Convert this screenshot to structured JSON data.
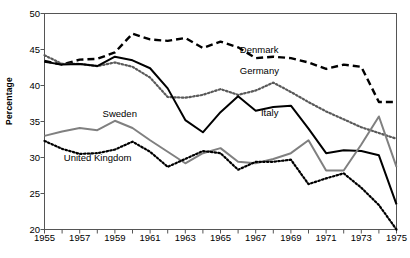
{
  "chart_data": {
    "type": "line",
    "title": "",
    "xlabel": "",
    "ylabel": "Percentage",
    "xlim": [
      1955,
      1975
    ],
    "ylim": [
      20,
      50
    ],
    "grid": false,
    "legend_position": "inline-annotations",
    "x": [
      1955,
      1956,
      1957,
      1958,
      1959,
      1960,
      1961,
      1962,
      1963,
      1964,
      1965,
      1966,
      1967,
      1968,
      1969,
      1970,
      1971,
      1972,
      1973,
      1974,
      1975
    ],
    "ytick_labels": [
      "20",
      "25",
      "30",
      "35",
      "40",
      "45",
      "50"
    ],
    "ytick_values": [
      20,
      25,
      30,
      35,
      40,
      45,
      50
    ],
    "xtick_labels": [
      "1955",
      "1957",
      "1959",
      "1961",
      "1963",
      "1965",
      "1967",
      "1969",
      "1971",
      "1973",
      "1975"
    ],
    "xtick_values": [
      1955,
      1957,
      1959,
      1961,
      1963,
      1965,
      1967,
      1969,
      1971,
      1973,
      1975
    ],
    "xtick_minor_values": [
      1956,
      1958,
      1960,
      1962,
      1964,
      1966,
      1968,
      1970,
      1972,
      1974
    ],
    "series": [
      {
        "name": "Denmark",
        "style": "dashed",
        "color": "#000000",
        "label_x": 1966.1,
        "label_y": 45.0,
        "values": [
          43.4,
          42.9,
          43.6,
          43.7,
          44.6,
          47.2,
          46.4,
          46.2,
          46.6,
          45.2,
          46.1,
          45.3,
          43.8,
          44.0,
          43.8,
          43.2,
          42.3,
          42.9,
          42.6,
          37.7,
          37.7
        ]
      },
      {
        "name": "Germany",
        "style": "dotted",
        "color": "#5a5a5a",
        "label_x": 1966.1,
        "label_y": 42.0,
        "values": [
          44.2,
          43.0,
          43.0,
          42.7,
          43.2,
          42.6,
          41.1,
          38.4,
          38.3,
          38.7,
          39.5,
          38.7,
          39.3,
          40.4,
          39.1,
          37.7,
          36.4,
          35.3,
          34.2,
          33.4,
          32.6
        ]
      },
      {
        "name": "Italy",
        "style": "solid",
        "color": "#000000",
        "label_x": 1967.3,
        "label_y": 36.2,
        "values": [
          43.3,
          42.9,
          43.0,
          42.7,
          44.0,
          43.5,
          42.4,
          39.6,
          35.2,
          33.5,
          36.3,
          38.5,
          36.5,
          37.0,
          37.2,
          34.0,
          30.6,
          31.0,
          30.9,
          30.3,
          23.5
        ]
      },
      {
        "name": "Sweden",
        "style": "solid",
        "color": "#808080",
        "label_x": 1958.3,
        "label_y": 36.0,
        "values": [
          33.0,
          33.6,
          34.1,
          33.8,
          35.1,
          34.1,
          32.4,
          30.8,
          29.2,
          30.6,
          31.3,
          29.4,
          29.2,
          29.8,
          30.6,
          32.4,
          28.2,
          28.2,
          31.8,
          35.7,
          28.7
        ]
      },
      {
        "name": "United Kingdom",
        "style": "dotted",
        "color": "#000000",
        "label_x": 1956.1,
        "label_y": 30.0,
        "values": [
          32.3,
          31.2,
          30.5,
          30.6,
          31.1,
          32.2,
          30.8,
          28.7,
          29.8,
          30.9,
          30.6,
          28.3,
          29.4,
          29.4,
          29.7,
          26.3,
          27.1,
          27.8,
          25.8,
          23.4,
          20.0
        ]
      }
    ]
  },
  "axis": {
    "y_title": "Percentage"
  },
  "colors": {
    "frame": "#555555",
    "text": "#000000",
    "gray_series": "#808080",
    "dark_gray_series": "#5a5a5a"
  }
}
